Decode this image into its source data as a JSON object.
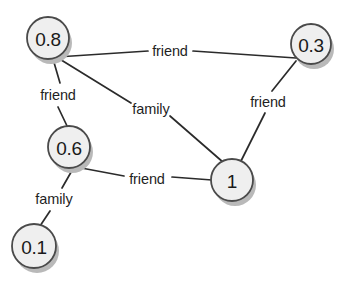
{
  "diagram": {
    "background_color": "#ffffff",
    "node_fill_color": "#efefef",
    "node_stroke_color": "#4a4a4a",
    "node_shadow_color": "#b9b9b9",
    "edge_color": "#2b2b2b",
    "label_color": "#1f1f1f"
  },
  "nodes": [
    {
      "id": "n08",
      "label": "0.8",
      "cx": 48,
      "cy": 38,
      "r": 21
    },
    {
      "id": "n03",
      "label": "0.3",
      "cx": 311,
      "cy": 44,
      "r": 20
    },
    {
      "id": "n06",
      "label": "0.6",
      "cx": 69,
      "cy": 147,
      "r": 21
    },
    {
      "id": "n1",
      "label": "1",
      "cx": 232,
      "cy": 180,
      "r": 21
    },
    {
      "id": "n01",
      "label": "0.1",
      "cx": 34,
      "cy": 246,
      "r": 22
    }
  ],
  "edges": [
    {
      "id": "e1",
      "source": "n08",
      "target": "n03",
      "label": "friend",
      "label_x": 170,
      "label_y": 51
    },
    {
      "id": "e2",
      "source": "n08",
      "target": "n06",
      "label": "friend",
      "label_x": 58,
      "label_y": 95
    },
    {
      "id": "e3",
      "source": "n08",
      "target": "n1",
      "label": "family",
      "label_x": 151,
      "label_y": 109
    },
    {
      "id": "e4",
      "source": "n03",
      "target": "n1",
      "label": "friend",
      "label_x": 268,
      "label_y": 102
    },
    {
      "id": "e5",
      "source": "n06",
      "target": "n1",
      "label": "friend",
      "label_x": 147,
      "label_y": 179
    },
    {
      "id": "e6",
      "source": "n06",
      "target": "n01",
      "label": "family",
      "label_x": 54,
      "label_y": 199
    }
  ],
  "edge_segments": [
    {
      "id": "e1",
      "points": "57,57 148,51"
    },
    {
      "id": "e1b",
      "points": "193,51 296,58"
    },
    {
      "id": "e2",
      "points": "53,59 60,83"
    },
    {
      "id": "e2b",
      "points": "58,107 68,128"
    },
    {
      "id": "e3",
      "points": "58,58 131,103"
    },
    {
      "id": "e3b",
      "points": "170,116 224,163"
    },
    {
      "id": "e4",
      "points": "296,61 272,91"
    },
    {
      "id": "e4b",
      "points": "265,113 241,161"
    },
    {
      "id": "e5",
      "points": "76,167 124,176"
    },
    {
      "id": "e5b",
      "points": "172,177 212,180"
    },
    {
      "id": "e6",
      "points": "74,167 62,188"
    },
    {
      "id": "e6b",
      "points": "50,211 40,226"
    }
  ]
}
